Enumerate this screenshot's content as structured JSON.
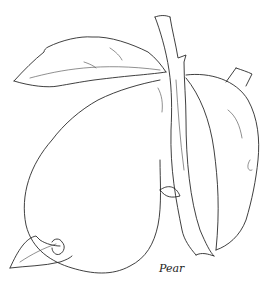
{
  "illustration": {
    "subject": "pear-line-drawing",
    "caption": "Pear",
    "stroke_color": "#2a2a2a",
    "background_color": "#ffffff"
  }
}
